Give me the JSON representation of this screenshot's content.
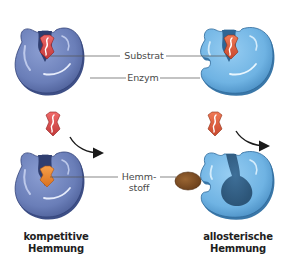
{
  "diagram": {
    "labels": {
      "substrate": "Substrat",
      "enzyme": "Enzym",
      "inhibitor_line1": "Hemm-",
      "inhibitor_line2": "stoff"
    },
    "captions": {
      "competitive_line1": "kompetitive",
      "competitive_line2": "Hemmung",
      "allosteric_line1": "allosterische",
      "allosteric_line2": "Hemmung"
    },
    "colors": {
      "enzyme_competitive": "#6b7fb8",
      "enzyme_competitive_dark": "#3e4f86",
      "enzyme_allosteric": "#6fb3e3",
      "enzyme_allosteric_dark": "#3a77a8",
      "substrate": "#d94848",
      "substrate_allosteric": "#dc5a3a",
      "inhibitor_competitive": "#ef8a2e",
      "inhibitor_allosteric": "#7a4a22",
      "leader_line": "#555555",
      "arrow": "#1a1a1a"
    },
    "icons": {
      "enzyme": "enzyme-blob-icon",
      "substrate": "substrate-diamond-icon",
      "inhibitor": "inhibitor-oval-icon",
      "arrow": "curved-arrow-icon"
    }
  }
}
